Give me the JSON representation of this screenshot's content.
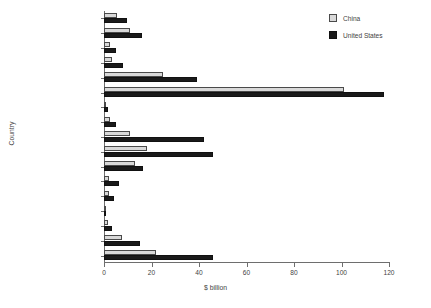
{
  "chart_data": {
    "type": "bar",
    "orientation": "horizontal",
    "title": "",
    "xlabel": "$ billion",
    "ylabel": "Country",
    "xlim": [
      0,
      120
    ],
    "xticks": [
      0,
      20,
      40,
      60,
      80,
      100,
      120
    ],
    "grid": false,
    "legend_position": "top-right",
    "categories": [
      "Austria",
      "Belgium-Luxembourg",
      "Czech Republic",
      "Denmark",
      "France",
      "Germany",
      "Greece",
      "Hungary",
      "Ireland",
      "Italy",
      "Netherlands",
      "Poland",
      "Portugal",
      "Serbia",
      "Slovakia",
      "Spain",
      "United Kingdom"
    ],
    "series": [
      {
        "name": "China",
        "color": "#d9d9d9",
        "values": [
          5.5,
          11,
          2.5,
          3.5,
          25,
          101,
          1,
          2.5,
          11,
          18,
          13,
          2,
          2,
          0.3,
          1.5,
          7.5,
          22
        ]
      },
      {
        "name": "United States",
        "color": "#1a1a1a",
        "values": [
          9.5,
          16,
          5,
          8,
          39,
          118,
          1.5,
          5,
          42,
          46,
          16.5,
          6.5,
          4,
          0.3,
          3.5,
          15,
          46
        ]
      }
    ]
  },
  "legend": {
    "items": [
      {
        "label": "China",
        "swatch": "china"
      },
      {
        "label": "United States",
        "swatch": "us"
      }
    ]
  }
}
